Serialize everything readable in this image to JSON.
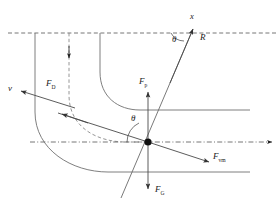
{
  "figure": {
    "name": "particle-force-balance-in-curved-flow",
    "type": "physics-vector-diagram",
    "background": "#ffffff",
    "stroke_color": "#555555",
    "accent_color": "#000000",
    "width": 279,
    "height": 212
  },
  "labels": {
    "velocity": {
      "text": "v",
      "x": 10,
      "y": 90,
      "italic": true
    },
    "drag_force": {
      "text": "F",
      "sub": "D",
      "x": 47,
      "y": 85
    },
    "pressure_force": {
      "text": "F",
      "sub": "p",
      "x": 140,
      "y": 83
    },
    "virtual_mass_force": {
      "text": "F",
      "sub": "vm",
      "x": 215,
      "y": 157
    },
    "gravity_force": {
      "text": "F",
      "sub": "G",
      "x": 155,
      "y": 191
    },
    "radius": {
      "text": "R",
      "x": 201,
      "y": 38
    },
    "x_axis": {
      "text": "x",
      "x": 191,
      "y": 18
    },
    "theta_top": {
      "text": "θ",
      "x": 174,
      "y": 36
    },
    "theta_center": {
      "text": "θ",
      "x": 133,
      "y": 120
    }
  },
  "geometry": {
    "particle": {
      "cx": 148,
      "cy": 142,
      "r": 3.6
    },
    "top_dashed_line": {
      "y": 33,
      "x1": 8,
      "x2": 277
    },
    "center_dashdot_line": {
      "y": 142,
      "x1": 30,
      "x2": 272
    },
    "dashed_streamline_x": 69,
    "solid_streamline_outer_x": 35,
    "solid_streamline_inner_x": 100,
    "horizontal_streamline_upper_y": 110,
    "horizontal_streamline_lower_y": 172,
    "streamline_right_end_x": 250,
    "radial_line": {
      "x1": 121,
      "y1": 196,
      "x2": 194,
      "y2": 26
    },
    "angle_theta_degrees": 66
  },
  "vectors": {
    "items": [
      {
        "name": "velocity-vector",
        "label": "v",
        "direction": "left-down-tangent"
      },
      {
        "name": "drag-force-vector",
        "label": "F_D",
        "direction": "upper-left-tangent"
      },
      {
        "name": "pressure-force-vector",
        "label": "F_p",
        "direction": "up"
      },
      {
        "name": "gravity-force-vector",
        "label": "F_G",
        "direction": "down"
      },
      {
        "name": "virtual-mass-force-vector",
        "label": "F_vm",
        "direction": "lower-right"
      },
      {
        "name": "radius-vector",
        "label": "R",
        "direction": "upper-right"
      }
    ]
  }
}
